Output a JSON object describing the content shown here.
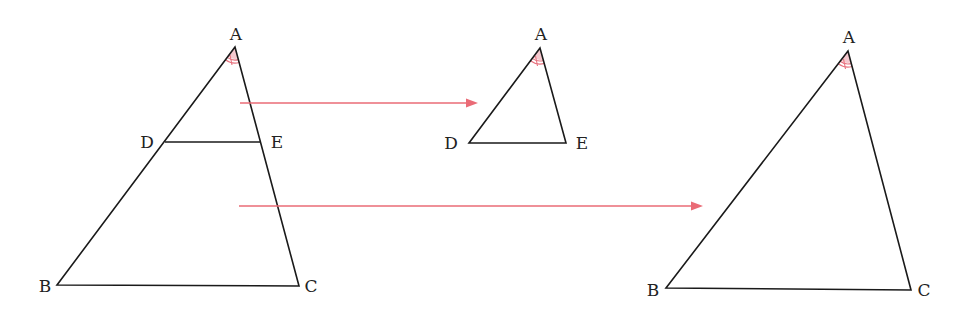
{
  "diagram": {
    "colors": {
      "line": "#1a1a1a",
      "arrow": "#ea6b76",
      "angle_fill": "#f6c9cf",
      "angle_arc": "#e8727f",
      "label": "#222222"
    },
    "figures": [
      {
        "name": "original-triangle-abc-with-de",
        "vertices": {
          "A": [
            235,
            47
          ],
          "B": [
            57,
            285
          ],
          "C": [
            299,
            286
          ],
          "D": [
            165,
            142
          ],
          "E": [
            261,
            142
          ]
        },
        "labels": [
          {
            "text": "A",
            "x": 236,
            "y": 40
          },
          {
            "text": "D",
            "x": 147,
            "y": 148
          },
          {
            "text": "E",
            "x": 276,
            "y": 148
          },
          {
            "text": "B",
            "x": 45,
            "y": 292
          },
          {
            "text": "C",
            "x": 311,
            "y": 292
          }
        ],
        "angle_mark_at": "A"
      },
      {
        "name": "extracted-triangle-ade",
        "vertices": {
          "A": [
            540,
            48
          ],
          "D": [
            469,
            143
          ],
          "E": [
            566,
            143
          ]
        },
        "labels": [
          {
            "text": "A",
            "x": 541,
            "y": 40
          },
          {
            "text": "D",
            "x": 451,
            "y": 149
          },
          {
            "text": "E",
            "x": 581,
            "y": 149
          }
        ],
        "angle_mark_at": "A"
      },
      {
        "name": "extracted-triangle-abc",
        "vertices": {
          "A": [
            848,
            51
          ],
          "B": [
            666,
            288
          ],
          "C": [
            911,
            290
          ]
        },
        "labels": [
          {
            "text": "A",
            "x": 849,
            "y": 43
          },
          {
            "text": "B",
            "x": 653,
            "y": 296
          },
          {
            "text": "C",
            "x": 924,
            "y": 296
          }
        ],
        "angle_mark_at": "A"
      }
    ],
    "arrows": [
      {
        "name": "arrow-to-ade",
        "from": [
          240,
          103
        ],
        "to": [
          478,
          103
        ]
      },
      {
        "name": "arrow-to-abc",
        "from": [
          239,
          206
        ],
        "to": [
          703,
          206
        ]
      }
    ]
  }
}
